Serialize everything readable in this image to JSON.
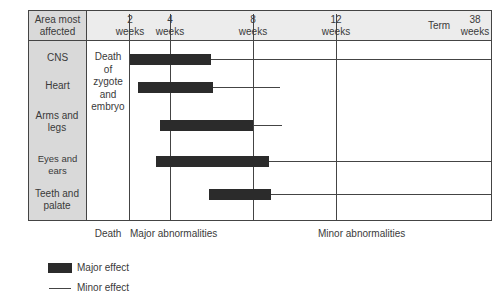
{
  "header": {
    "area_label": "Area most affected",
    "weeks": [
      {
        "num": "2",
        "unit": "weeks"
      },
      {
        "num": "4",
        "unit": "weeks"
      },
      {
        "num": "8",
        "unit": "weeks"
      },
      {
        "num": "12",
        "unit": "weeks"
      }
    ],
    "term_label": "Term",
    "term_weeks": {
      "num": "38",
      "unit": "weeks"
    }
  },
  "rows": [
    {
      "area": "CNS",
      "major_start": 2,
      "major_end": 6,
      "minor_end": 38
    },
    {
      "area": "Heart",
      "major_start": 2.4,
      "major_end": 6.1,
      "minor_end": 9.5
    },
    {
      "area": "Arms and legs",
      "major_start": 3.5,
      "major_end": 8,
      "minor_end": 9.5
    },
    {
      "area": "Eyes and ears",
      "major_start": 3.3,
      "major_end": 8.8,
      "minor_end": 38
    },
    {
      "area": "Teeth and palate",
      "major_start": 6.7,
      "major_end": 9,
      "minor_end": 38
    }
  ],
  "death_column": {
    "lines": [
      "Death",
      "of",
      "zygote",
      "and",
      "embryo"
    ]
  },
  "footer": {
    "death": "Death",
    "major": "Major abnormalities",
    "minor": "Minor abnormalities"
  },
  "legend": {
    "major": "Major effect",
    "minor": "Minor effect"
  },
  "colors": {
    "bar": "#2b2b2b",
    "line": "#444444",
    "left_column": "#d9d9d9",
    "header": "#ececec"
  }
}
